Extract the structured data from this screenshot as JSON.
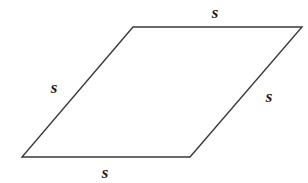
{
  "figure": {
    "shape_name": "rhombus",
    "background_color": "#ffffff",
    "stroke_color": "#3a3a3a",
    "stroke_width": 1.4,
    "fill_color": "none",
    "label_color": "#1c1c1c",
    "vertices": {
      "top_left": {
        "x": 133,
        "y": 27
      },
      "top_right": {
        "x": 302,
        "y": 27
      },
      "bottom_right": {
        "x": 190,
        "y": 157
      },
      "bottom_left": {
        "x": 22,
        "y": 157
      }
    },
    "polygon_points": "133,27 302,27 190,157 22,157",
    "labels": {
      "top": "s",
      "left": "s",
      "right": "s",
      "bottom": "s"
    }
  }
}
